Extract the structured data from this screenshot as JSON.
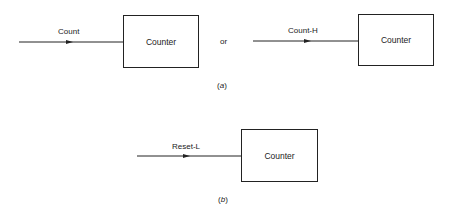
{
  "diagram": {
    "part_a": {
      "caption_open": "(",
      "caption_letter": "a",
      "caption_close": ")",
      "left": {
        "signal_label": "Count",
        "block_label": "Counter"
      },
      "connector": "or",
      "right": {
        "signal_label": "Count-H",
        "block_label": "Counter"
      }
    },
    "part_b": {
      "caption_open": "(",
      "caption_letter": "b",
      "caption_close": ")",
      "signal_label": "Reset-L",
      "block_label": "Counter"
    },
    "colors": {
      "line": "#222222",
      "background": "#ffffff"
    }
  }
}
